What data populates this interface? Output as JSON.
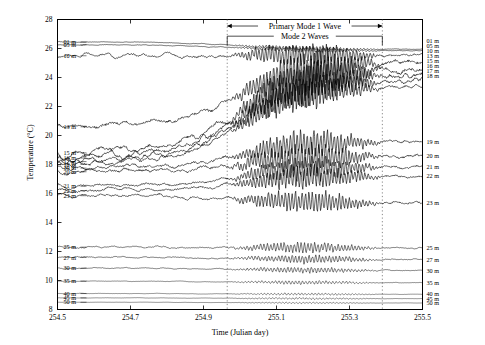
{
  "chart_data": {
    "type": "line",
    "title": "",
    "xlabel": "Time (Julian day)",
    "ylabel": "Temperature (°C)",
    "xlim": [
      254.5,
      255.5
    ],
    "ylim": [
      8,
      28
    ],
    "xticks": [
      "254.5",
      "254.7",
      "254.9",
      "255.1",
      "255.3",
      "255.5"
    ],
    "xtick_values": [
      254.5,
      254.7,
      254.9,
      255.1,
      255.3,
      255.5
    ],
    "yticks": [
      "8",
      "10",
      "12",
      "14",
      "16",
      "18",
      "20",
      "22",
      "24",
      "26",
      "28"
    ],
    "ytick_values": [
      8,
      10,
      12,
      14,
      16,
      18,
      20,
      22,
      24,
      26,
      28
    ],
    "grid": false,
    "legend_position": "inline-left-and-right",
    "reference_lines": [
      {
        "name": "mode2-start",
        "x": 254.965,
        "style": "dotted"
      },
      {
        "name": "mode2-end",
        "x": 255.39,
        "style": "dotted"
      }
    ],
    "annotations": [
      {
        "name": "primary-mode-1-wave",
        "label": "Primary Mode 1 Wave",
        "x_start": 254.965,
        "x_end": 255.39,
        "y": 27.55,
        "style": "double-arrow"
      },
      {
        "name": "mode-2-waves",
        "label": "Mode 2 Waves",
        "x_start": 254.965,
        "x_end": 255.39,
        "y": 26.85,
        "style": "bracket"
      }
    ],
    "series": [
      {
        "name": "01 m",
        "label_left": "01 m",
        "label_right": "01 m",
        "y_left": 26.45,
        "y_right": 25.95,
        "amplitude": 0.18,
        "seed": 11,
        "weight": 0.9
      },
      {
        "name": "05 m",
        "label_left": "05 m",
        "label_right": "05 m",
        "y_left": 26.25,
        "y_right": 25.85,
        "amplitude": 0.2,
        "seed": 23,
        "weight": 0.9
      },
      {
        "name": "10 m",
        "label_left": "10 m",
        "label_right": "10 m",
        "y_left": 25.5,
        "y_right": 25.55,
        "amplitude": 0.95,
        "seed": 37,
        "weight": 1.0
      },
      {
        "name": "13 m",
        "label_left": "13 m",
        "label_right": "13 m",
        "y_left": 20.6,
        "y_right": 25.1,
        "amplitude": 1.5,
        "seed": 41,
        "weight": 1.0
      },
      {
        "name": "15 m",
        "label_left": "15 m",
        "label_right": "15 m",
        "y_left": 18.8,
        "y_right": 24.6,
        "amplitude": 1.6,
        "seed": 53,
        "weight": 1.0
      },
      {
        "name": "16 m",
        "label_left": "16 m",
        "label_right": "16 m",
        "y_left": 18.45,
        "y_right": 24.2,
        "amplitude": 1.5,
        "seed": 61,
        "weight": 1.0
      },
      {
        "name": "17 m",
        "label_left": "17 m",
        "label_right": "17 m",
        "y_left": 18.2,
        "y_right": 23.8,
        "amplitude": 1.35,
        "seed": 67,
        "weight": 1.0
      },
      {
        "name": "18 m",
        "label_left": "18 m",
        "label_right": "18 m",
        "y_left": 18.0,
        "y_right": 23.4,
        "amplitude": 1.2,
        "seed": 71,
        "weight": 1.0
      },
      {
        "name": "19 m",
        "label_left": "19 m",
        "label_right": "19 m",
        "y_left": 17.75,
        "y_right": 19.6,
        "amplitude": 1.1,
        "seed": 79,
        "weight": 1.0
      },
      {
        "name": "20 m",
        "label_left": "20 m",
        "label_right": "20 m",
        "y_left": 17.5,
        "y_right": 18.6,
        "amplitude": 1.15,
        "seed": 83,
        "weight": 1.0
      },
      {
        "name": "21 m",
        "label_left": "21 m",
        "label_right": "21 m",
        "y_left": 16.5,
        "y_right": 17.85,
        "amplitude": 1.0,
        "seed": 89,
        "weight": 1.0
      },
      {
        "name": "22 m",
        "label_left": "22 m",
        "label_right": "22 m",
        "y_left": 16.2,
        "y_right": 17.2,
        "amplitude": 0.95,
        "seed": 97,
        "weight": 1.0
      },
      {
        "name": "23 m",
        "label_left": "23 m",
        "label_right": "23 m",
        "y_left": 15.85,
        "y_right": 15.35,
        "amplitude": 0.9,
        "seed": 101,
        "weight": 1.0
      },
      {
        "name": "25 m",
        "label_left": "25 m",
        "label_right": "25 m",
        "y_left": 12.3,
        "y_right": 12.25,
        "amplitude": 0.45,
        "seed": 103,
        "weight": 0.85
      },
      {
        "name": "27 m",
        "label_left": "27 m",
        "label_right": "27 m",
        "y_left": 11.6,
        "y_right": 11.45,
        "amplitude": 0.35,
        "seed": 107,
        "weight": 0.85
      },
      {
        "name": "30 m",
        "label_left": "30 m",
        "label_right": "30 m",
        "y_left": 10.85,
        "y_right": 10.7,
        "amplitude": 0.25,
        "seed": 109,
        "weight": 0.8
      },
      {
        "name": "35 m",
        "label_left": "35 m",
        "label_right": "35 m",
        "y_left": 9.95,
        "y_right": 9.85,
        "amplitude": 0.16,
        "seed": 113,
        "weight": 0.75
      },
      {
        "name": "40 m",
        "label_left": "40 m",
        "label_right": "40 m",
        "y_left": 9.1,
        "y_right": 9.05,
        "amplitude": 0.1,
        "seed": 127,
        "weight": 0.7
      },
      {
        "name": "45 m",
        "label_left": "45 m",
        "label_right": "45 m",
        "y_left": 8.8,
        "y_right": 8.75,
        "amplitude": 0.08,
        "seed": 131,
        "weight": 0.7
      },
      {
        "name": "50 m",
        "label_left": "50 m",
        "label_right": "50 m",
        "y_left": 8.5,
        "y_right": 8.45,
        "amplitude": 0.06,
        "seed": 137,
        "weight": 0.7
      }
    ],
    "right_stack_labels": [
      "01 m",
      "05 m",
      "10 m",
      "13 m",
      "15 m",
      "16 m",
      "17 m",
      "18 m"
    ]
  }
}
